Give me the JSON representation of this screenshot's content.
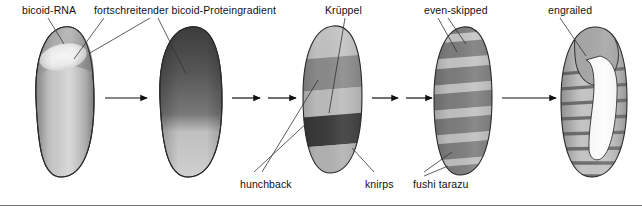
{
  "figure": {
    "title_visible": false,
    "background_color": "#ffffff",
    "border_color": "#6f6f6f",
    "label_color": "#111111",
    "labels_top": [
      {
        "id": "bicoid-rna",
        "text": "bicoid-RNA",
        "x": 22,
        "y": 4
      },
      {
        "id": "bicoid-gradient",
        "text": "fortschreitender bicoid-Proteingradient",
        "x": 94,
        "y": 4
      },
      {
        "id": "kruppel",
        "text": "Krüppel",
        "x": 325,
        "y": 4
      },
      {
        "id": "even-skipped",
        "text": "even-skipped",
        "x": 424,
        "y": 4
      },
      {
        "id": "engrailed",
        "text": "engrailed",
        "x": 548,
        "y": 4
      }
    ],
    "labels_bottom": [
      {
        "id": "hunchback",
        "text": "hunchback",
        "x": 240,
        "y": 178
      },
      {
        "id": "knirps",
        "text": "knirps",
        "x": 365,
        "y": 178
      },
      {
        "id": "fushi-tarazu",
        "text": "fushi tarazu",
        "x": 413,
        "y": 178
      }
    ],
    "embryos": [
      {
        "id": "embryo-1",
        "stage": "bicoid-RNA localized at anterior pole",
        "cx": 62,
        "fill_light": "#d4d4d4",
        "fill_mid": "#a9a9a9",
        "highlight": "#f4f4f4"
      },
      {
        "id": "embryo-2",
        "stage": "advancing bicoid protein gradient",
        "cx": 190,
        "fill_dark": "#4a4a4a",
        "fill_light": "#c9c9c9"
      },
      {
        "id": "embryo-3",
        "stage": "gap gene domains: hunchback, Kruppel, knirps",
        "cx": 330,
        "bands": [
          {
            "name": "anterior-light",
            "color": "#c3c3c3"
          },
          {
            "name": "hunchback-band",
            "color": "#8d8d8d"
          },
          {
            "name": "kruppel-band",
            "color": "#b9b9b9"
          },
          {
            "name": "knirps-band",
            "color": "#3b3b3b"
          },
          {
            "name": "posterior-light",
            "color": "#b0b0b0"
          }
        ]
      },
      {
        "id": "embryo-4",
        "stage": "pair-rule stripes: even-skipped, fushi tarazu",
        "cx": 462,
        "stripe_count": 7,
        "stripe_color": "#7c7c7c",
        "interstripe_color": "#c2c2c2"
      },
      {
        "id": "embryo-5",
        "stage": "engrailed segment-polarity stripes, germ band extended",
        "cx": 592,
        "stripe_count": 9,
        "stripe_color": "#6e6e6e",
        "body_color": "#bdbdbd"
      }
    ],
    "arrows": [
      {
        "id": "arrow-1",
        "x1": 108,
        "x2": 148,
        "y": 98,
        "length": "long"
      },
      {
        "id": "arrow-2",
        "x1": 234,
        "x2": 262,
        "y": 98,
        "length": "short"
      },
      {
        "id": "arrow-3",
        "x1": 268,
        "x2": 296,
        "y": 98,
        "length": "short"
      },
      {
        "id": "arrow-4",
        "x1": 372,
        "x2": 400,
        "y": 98,
        "length": "short"
      },
      {
        "id": "arrow-5",
        "x1": 406,
        "x2": 434,
        "y": 98,
        "length": "short"
      },
      {
        "id": "arrow-6",
        "x1": 504,
        "x2": 556,
        "y": 98,
        "length": "long"
      }
    ]
  }
}
